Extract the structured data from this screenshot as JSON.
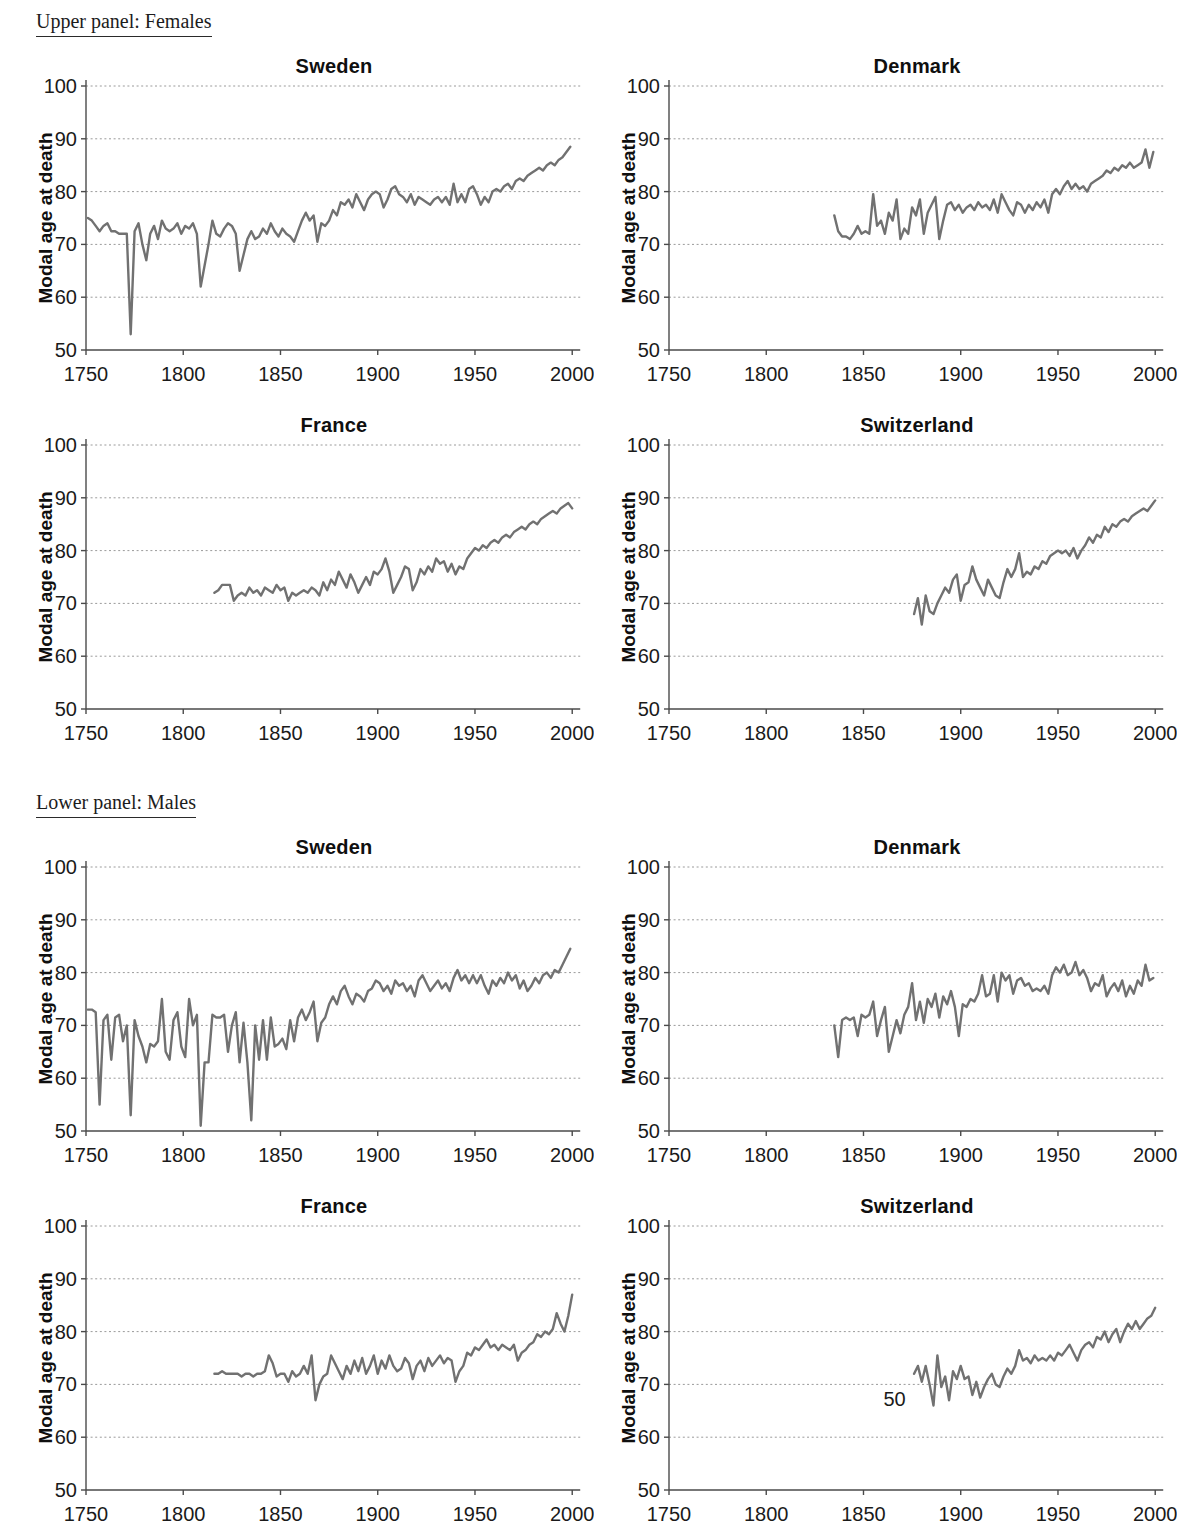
{
  "page": {
    "background": "#ffffff"
  },
  "panels": [
    {
      "header": "Upper panel: Females"
    },
    {
      "header": "Lower panel: Males"
    }
  ],
  "chart_data": {
    "type": "line",
    "ylabel": "Modal age at death",
    "xlabel": "",
    "x_ticks": [
      1750,
      1800,
      1850,
      1900,
      1950,
      2000
    ],
    "y_ticks": [
      50,
      60,
      70,
      80,
      90,
      100
    ],
    "xlim": [
      1750,
      2004
    ],
    "ylim": [
      50,
      100
    ],
    "grid": "horizontal dotted",
    "legend": "none",
    "line_color": "#717171",
    "charts": [
      {
        "panel": "Females",
        "country": "Sweden",
        "title": "Sweden",
        "series": {
          "name": "Sweden females",
          "start_year": 1751,
          "step_years": 2,
          "values": [
            75,
            74.5,
            73.5,
            72.5,
            73.5,
            74,
            72.5,
            72.5,
            72,
            72,
            72,
            53,
            72.5,
            74,
            70,
            67,
            72,
            73.5,
            71,
            74.5,
            73,
            72.5,
            73,
            74,
            72,
            73.5,
            73,
            74,
            72,
            62,
            66,
            70,
            74.5,
            72,
            71.5,
            73,
            74,
            73.5,
            72,
            65,
            68,
            71,
            72.5,
            71,
            71.5,
            73,
            72,
            74,
            72.5,
            71.5,
            73,
            72,
            71.5,
            70.5,
            72.5,
            74.5,
            76,
            74.5,
            75.5,
            70.5,
            74,
            73.5,
            74.5,
            76.5,
            75.5,
            78,
            77.5,
            78.5,
            77,
            79.5,
            78,
            76.5,
            78.5,
            79.5,
            80,
            79.5,
            77,
            78.5,
            80.5,
            81,
            79.5,
            79,
            78,
            79.5,
            77.5,
            79,
            78.5,
            78,
            77.5,
            78.5,
            79,
            78,
            79,
            77.5,
            81.5,
            78,
            79.5,
            78,
            80.5,
            81,
            79.5,
            77.5,
            79,
            78,
            80,
            80.5,
            80,
            81,
            81.5,
            80.5,
            82,
            82.5,
            82,
            83,
            83.5,
            84,
            84.5,
            84,
            85,
            85.5,
            85,
            86,
            86.5,
            87.5,
            88.5
          ]
        },
        "annotations": []
      },
      {
        "panel": "Females",
        "country": "Denmark",
        "title": "Denmark",
        "series": {
          "name": "Denmark females",
          "start_year": 1835,
          "step_years": 2,
          "values": [
            75.5,
            72.5,
            71.5,
            71.5,
            71,
            72,
            73.5,
            72,
            72.5,
            72,
            79.5,
            73.5,
            74.5,
            72,
            76,
            74.5,
            78.5,
            71,
            73,
            72,
            77,
            75.5,
            78.5,
            72,
            76,
            77.5,
            79,
            71,
            74.5,
            77.5,
            78,
            76.5,
            77.5,
            76,
            77,
            77.5,
            76.5,
            78,
            77,
            77.5,
            76.5,
            78.5,
            76,
            79.5,
            78,
            76.5,
            75.5,
            78,
            77.5,
            76,
            77.5,
            76.5,
            78,
            77,
            78.5,
            76,
            79.5,
            80.5,
            79.5,
            81,
            82,
            80.5,
            81.5,
            80.5,
            81,
            80,
            81.5,
            82,
            82.5,
            83,
            84,
            83.5,
            84.5,
            84,
            85,
            84.5,
            85.5,
            84.5,
            85,
            85.5,
            88,
            84.5,
            87.5
          ]
        },
        "annotations": []
      },
      {
        "panel": "Females",
        "country": "France",
        "title": "France",
        "series": {
          "name": "France females",
          "start_year": 1816,
          "step_years": 2,
          "values": [
            72,
            72.5,
            73.5,
            73.5,
            73.5,
            70.5,
            71.5,
            72,
            71.5,
            73,
            72,
            72.5,
            71.5,
            73,
            72.5,
            72,
            73.5,
            72.5,
            73,
            70.5,
            72,
            71.5,
            72,
            72.5,
            72,
            73,
            72.5,
            71.5,
            74,
            72.5,
            74.5,
            73.5,
            76,
            74.5,
            73,
            75.5,
            74,
            72,
            73.5,
            75,
            73.5,
            76,
            75.5,
            76.5,
            78.5,
            76,
            72,
            73.5,
            75,
            77,
            76.5,
            72.5,
            74,
            76.5,
            75.5,
            77,
            76,
            78.5,
            77.5,
            78,
            76,
            77.5,
            75.5,
            77,
            76.5,
            78.5,
            79.5,
            80.5,
            80,
            81,
            80.5,
            81.5,
            82,
            81.5,
            82.5,
            83,
            82.5,
            83.5,
            84,
            84.5,
            84,
            85,
            85.5,
            85,
            86,
            86.5,
            87,
            87.5,
            87,
            88,
            88.5,
            89,
            88
          ]
        },
        "annotations": []
      },
      {
        "panel": "Females",
        "country": "Switzerland",
        "title": "Switzerland",
        "series": {
          "name": "Switzerland females",
          "start_year": 1876,
          "step_years": 2,
          "values": [
            68,
            71,
            66,
            71.5,
            68.5,
            68,
            70,
            71.5,
            73,
            72,
            74.5,
            75.5,
            70.5,
            73.5,
            74,
            77,
            74.5,
            73,
            71.5,
            74.5,
            73,
            71.5,
            71,
            74,
            76.5,
            75,
            76.5,
            79.5,
            75,
            76,
            75.5,
            77,
            76.5,
            78,
            77.5,
            79,
            79.5,
            80,
            79.5,
            80,
            79,
            80.5,
            78.5,
            80,
            81,
            82.5,
            81.5,
            83,
            82.5,
            84.5,
            83.5,
            85,
            84.5,
            85.5,
            86,
            85.5,
            86.5,
            87,
            87.5,
            88,
            87.5,
            88.5,
            89.5
          ]
        },
        "annotations": []
      },
      {
        "panel": "Males",
        "country": "Sweden",
        "title": "Sweden",
        "series": {
          "name": "Sweden males",
          "start_year": 1751,
          "step_years": 2,
          "values": [
            73,
            73,
            72.5,
            55,
            71,
            72,
            63.5,
            71.5,
            72,
            67,
            70,
            53,
            71,
            68,
            66,
            63,
            66.5,
            66,
            67,
            75,
            65,
            63.5,
            71,
            72.5,
            66,
            64,
            75,
            70,
            72,
            51,
            63,
            63,
            72,
            71.5,
            71.5,
            72,
            65,
            70,
            72.5,
            63,
            70.5,
            63,
            52,
            70,
            63.5,
            71,
            63.5,
            71.5,
            66,
            66.5,
            67.5,
            65.5,
            71,
            67,
            71.5,
            73,
            71,
            72.5,
            74.5,
            67,
            70.5,
            71.5,
            74,
            75.5,
            74,
            76.5,
            77.5,
            75.5,
            74,
            76,
            75.5,
            74.5,
            76.5,
            77,
            78.5,
            78,
            76.5,
            77.5,
            76,
            78.5,
            77.5,
            78,
            76.5,
            77.5,
            75.5,
            78.5,
            79.5,
            78,
            76.5,
            77.5,
            78.5,
            77,
            78,
            76.5,
            79,
            80.5,
            78.5,
            79.5,
            78,
            79.5,
            78,
            79.5,
            77.5,
            76,
            78.5,
            77.5,
            79,
            78,
            80,
            78.5,
            79.5,
            77,
            78.5,
            76.5,
            77.5,
            79,
            78,
            79.5,
            80,
            79,
            80.5,
            80,
            81.5,
            83,
            84.5
          ]
        },
        "annotations": []
      },
      {
        "panel": "Males",
        "country": "Denmark",
        "title": "Denmark",
        "series": {
          "name": "Denmark males",
          "start_year": 1835,
          "step_years": 2,
          "values": [
            70,
            64,
            71,
            71.5,
            71,
            71.5,
            68,
            72,
            71.5,
            72,
            74.5,
            68,
            71,
            73.5,
            65,
            68,
            71,
            68.5,
            72,
            73.5,
            78,
            71,
            74.5,
            70.5,
            75,
            73.5,
            76,
            71.5,
            75.5,
            74,
            76.5,
            73.5,
            68,
            74,
            73.5,
            75,
            74.5,
            76,
            79.5,
            75.5,
            76,
            79.5,
            74.5,
            80,
            78.5,
            79.5,
            76,
            78.5,
            79,
            77.5,
            78,
            76.5,
            77,
            76.5,
            77.5,
            76,
            79.5,
            81,
            80,
            81.5,
            79.5,
            80,
            82,
            79.5,
            80.5,
            79,
            76.5,
            78,
            77.5,
            79.5,
            75.5,
            77,
            78,
            76.5,
            78.5,
            75.5,
            77.5,
            76,
            78.5,
            77.5,
            81.5,
            78.5,
            79
          ]
        },
        "annotations": []
      },
      {
        "panel": "Males",
        "country": "France",
        "title": "France",
        "series": {
          "name": "France males",
          "start_year": 1816,
          "step_years": 2,
          "values": [
            72,
            72,
            72.5,
            72,
            72,
            72,
            72,
            71.5,
            72,
            72,
            71.5,
            72,
            72,
            72.5,
            75.5,
            74,
            71.5,
            72,
            72,
            70.5,
            72.5,
            71.5,
            72,
            73.5,
            72,
            75.5,
            67,
            70,
            71.5,
            72,
            75.5,
            74,
            72.5,
            71,
            73.5,
            72,
            74.5,
            72.5,
            75,
            72,
            73.5,
            75.5,
            72,
            74.5,
            73,
            75.5,
            73.5,
            72.5,
            73,
            75,
            74,
            71,
            73.5,
            74.5,
            72.5,
            75,
            73.5,
            74.5,
            75.5,
            74,
            75,
            74.5,
            70.5,
            72.5,
            73.5,
            76,
            75.5,
            77,
            76.5,
            77.5,
            78.5,
            77,
            77.5,
            76.5,
            77.5,
            77,
            76.5,
            77.5,
            74.5,
            76,
            76.5,
            77.5,
            78,
            79.5,
            79,
            80,
            79.5,
            80.5,
            83.5,
            81.5,
            80,
            83,
            87
          ]
        },
        "annotations": []
      },
      {
        "panel": "Males",
        "country": "Switzerland",
        "title": "Switzerland",
        "series": {
          "name": "Switzerland males",
          "start_year": 1876,
          "step_years": 2,
          "values": [
            72,
            73.5,
            70.5,
            73.5,
            70,
            66,
            75.5,
            69.5,
            71.5,
            67,
            72.5,
            71,
            73.5,
            71,
            71.5,
            68,
            70.5,
            67.5,
            69.5,
            71,
            72,
            70,
            69.5,
            71.5,
            73,
            72,
            73.5,
            76.5,
            74.5,
            75,
            74,
            75.5,
            74.5,
            75,
            74.5,
            75.5,
            74.5,
            76,
            75.5,
            76.5,
            77.5,
            76,
            74.5,
            76.5,
            77.5,
            78,
            77,
            79,
            78.5,
            80,
            78,
            79.5,
            80.5,
            78,
            80,
            81.5,
            80.5,
            82,
            80.5,
            81.5,
            82.5,
            83,
            84.5
          ]
        },
        "annotations": [
          {
            "text": "50",
            "year": 1866,
            "value": 67.2
          }
        ]
      }
    ]
  }
}
